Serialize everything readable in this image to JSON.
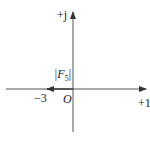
{
  "diagram": {
    "type": "phasor-diagram",
    "axes": {
      "real_label": "+1",
      "imag_label": "+j",
      "origin_label": "O"
    },
    "vector": {
      "name": "F5",
      "magnitude_label_prefix": "|F",
      "magnitude_label_sub": "5",
      "magnitude_label_suffix": "|",
      "endpoint_label": "−3",
      "endpoint_value": -3
    },
    "colors": {
      "line": "#333333",
      "background": "#ffffff"
    }
  }
}
